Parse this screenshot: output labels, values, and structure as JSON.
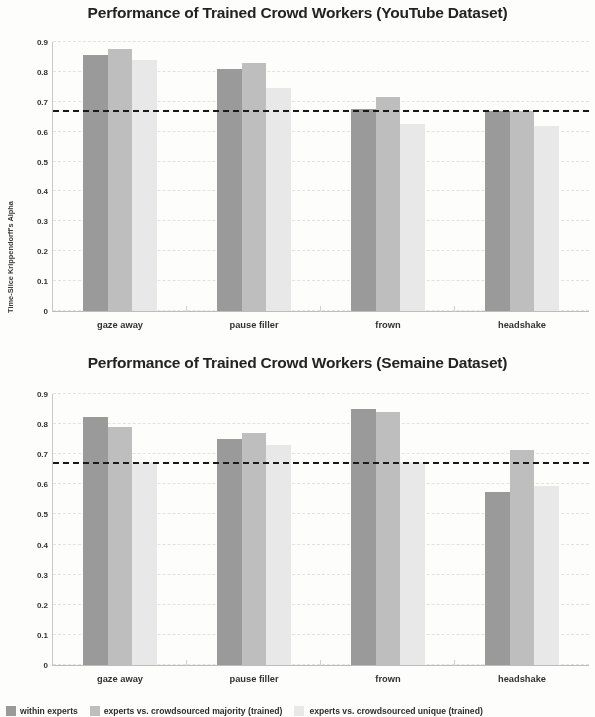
{
  "figure": {
    "ylabel": "Time-Slice Krippendorff's Alpha"
  },
  "legend": {
    "items": [
      {
        "label": "within experts",
        "color": "#9a9a9a",
        "swatch": "legend-swatch-within-experts"
      },
      {
        "label": "experts vs. crowdsourced majority (trained)",
        "color": "#bebebe",
        "swatch": "legend-swatch-majority"
      },
      {
        "label": "experts vs. crowdsourced unique (trained)",
        "color": "#e8e8e8",
        "swatch": "legend-swatch-unique"
      }
    ]
  },
  "chart_data": [
    {
      "type": "bar",
      "title": "Performance of Trained Crowd Workers (YouTube Dataset)",
      "xlabel": "",
      "ylabel": "Time-Slice Krippendorff's Alpha",
      "ylim": [
        0,
        0.9
      ],
      "yticks": [
        "0.9",
        "0.8",
        "0.7",
        "0.6",
        "0.5",
        "0.4",
        "0.3",
        "0.2",
        "0.1",
        "0"
      ],
      "ytick_values": [
        0.9,
        0.8,
        0.7,
        0.6,
        0.5,
        0.4,
        0.3,
        0.2,
        0.1,
        0
      ],
      "grid": true,
      "legend_position": "bottom",
      "categories": [
        "gaze away",
        "pause filler",
        "frown",
        "headshake"
      ],
      "series": [
        {
          "name": "within experts",
          "color": "#9a9a9a",
          "values": [
            0.855,
            0.81,
            0.675,
            0.67
          ]
        },
        {
          "name": "experts vs. crowdsourced majority (trained)",
          "color": "#bebebe",
          "values": [
            0.875,
            0.83,
            0.715,
            0.67
          ]
        },
        {
          "name": "experts vs. crowdsourced unique (trained)",
          "color": "#e8e8e8",
          "values": [
            0.84,
            0.745,
            0.625,
            0.62
          ]
        }
      ],
      "threshold_line": {
        "value": 0.667,
        "style": "dashed",
        "color": "#1a1a1a"
      }
    },
    {
      "type": "bar",
      "title": "Performance of Trained Crowd Workers (Semaine Dataset)",
      "xlabel": "",
      "ylabel": "Time-Slice Krippendorff's Alpha",
      "ylim": [
        0,
        0.9
      ],
      "yticks": [
        "0.9",
        "0.8",
        "0.7",
        "0.6",
        "0.5",
        "0.4",
        "0.3",
        "0.2",
        "0.1",
        "0"
      ],
      "ytick_values": [
        0.9,
        0.8,
        0.7,
        0.6,
        0.5,
        0.4,
        0.3,
        0.2,
        0.1,
        0
      ],
      "grid": true,
      "legend_position": "bottom",
      "categories": [
        "gaze away",
        "pause filler",
        "frown",
        "headshake"
      ],
      "series": [
        {
          "name": "within experts",
          "color": "#9a9a9a",
          "values": [
            0.825,
            0.75,
            0.85,
            0.575
          ]
        },
        {
          "name": "experts vs. crowdsourced majority (trained)",
          "color": "#bebebe",
          "values": [
            0.79,
            0.77,
            0.84,
            0.715
          ]
        },
        {
          "name": "experts vs. crowdsourced unique (trained)",
          "color": "#e8e8e8",
          "values": [
            0.675,
            0.73,
            0.675,
            0.595
          ]
        }
      ],
      "threshold_line": {
        "value": 0.667,
        "style": "dashed",
        "color": "#1a1a1a"
      }
    }
  ]
}
